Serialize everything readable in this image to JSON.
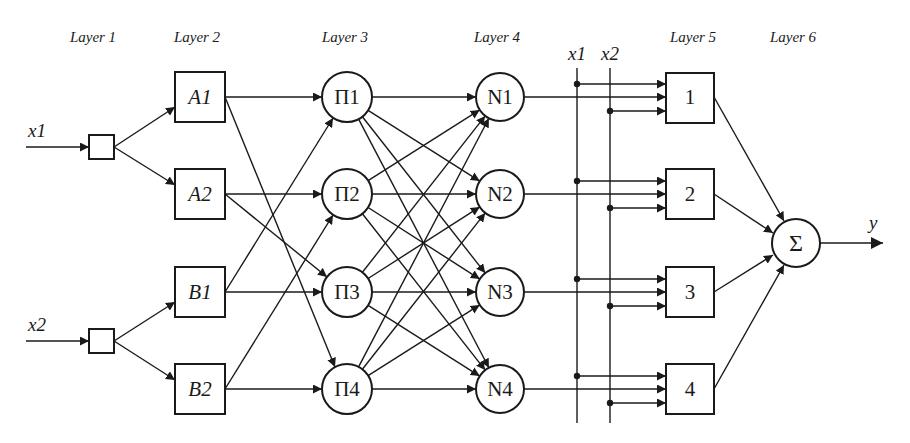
{
  "layers": [
    {
      "id": "L1",
      "label": "Layer 1",
      "x": 93
    },
    {
      "id": "L2",
      "label": "Layer 2",
      "x": 197
    },
    {
      "id": "L3",
      "label": "Layer 3",
      "x": 345
    },
    {
      "id": "L4",
      "label": "Layer 4",
      "x": 497
    },
    {
      "id": "L5",
      "label": "Layer 5",
      "x": 693
    },
    {
      "id": "L6",
      "label": "Layer 6",
      "x": 793
    }
  ],
  "inputs": [
    {
      "id": "x1",
      "label": "x1",
      "y": 147
    },
    {
      "id": "x2",
      "label": "x2",
      "y": 341
    }
  ],
  "bus": {
    "lines": [
      {
        "id": "x1",
        "label": "x1",
        "x": 577
      },
      {
        "id": "x2",
        "label": "x2",
        "x": 610
      }
    ],
    "y_top": 68,
    "y_bottom": 423
  },
  "membership_nodes": [
    {
      "id": "A1",
      "label": "A1",
      "y": 97
    },
    {
      "id": "A2",
      "label": "A2",
      "y": 194
    },
    {
      "id": "B1",
      "label": "B1",
      "y": 292
    },
    {
      "id": "B2",
      "label": "B2",
      "y": 389
    }
  ],
  "rule_nodes": [
    {
      "id": "P1",
      "label": "Π1",
      "y": 97
    },
    {
      "id": "P2",
      "label": "Π2",
      "y": 194
    },
    {
      "id": "P3",
      "label": "Π3",
      "y": 292
    },
    {
      "id": "P4",
      "label": "Π4",
      "y": 389
    }
  ],
  "norm_nodes": [
    {
      "id": "N1",
      "label": "N1",
      "y": 97
    },
    {
      "id": "N2",
      "label": "N2",
      "y": 194
    },
    {
      "id": "N3",
      "label": "N3",
      "y": 292
    },
    {
      "id": "N4",
      "label": "N4",
      "y": 389
    }
  ],
  "consequent_nodes": [
    {
      "id": "C1",
      "label": "1",
      "y": 97
    },
    {
      "id": "C2",
      "label": "2",
      "y": 194
    },
    {
      "id": "C3",
      "label": "3",
      "y": 292
    },
    {
      "id": "C4",
      "label": "4",
      "y": 389
    }
  ],
  "sum_node": {
    "id": "S",
    "label": "Σ",
    "x": 796,
    "y": 243
  },
  "output": {
    "label": "y"
  },
  "edges_L2_L3": [
    [
      "A1",
      "P1"
    ],
    [
      "A1",
      "P4"
    ],
    [
      "A2",
      "P2"
    ],
    [
      "A2",
      "P3"
    ],
    [
      "B1",
      "P1"
    ],
    [
      "B1",
      "P3"
    ],
    [
      "B2",
      "P2"
    ],
    [
      "B2",
      "P4"
    ]
  ],
  "edges_L3_L4": "fully-connected"
}
